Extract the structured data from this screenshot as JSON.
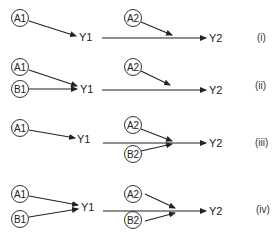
{
  "panels": [
    {
      "id": "i",
      "label": "(i)",
      "nodes": {
        "a1": "A1",
        "y1": "Y1",
        "a2": "A2",
        "y2": "Y2"
      }
    },
    {
      "id": "ii",
      "label": "(ii)",
      "nodes": {
        "a1": "A1",
        "b1": "B1",
        "y1": "Y1",
        "a2": "A2",
        "y2": "Y2"
      }
    },
    {
      "id": "iii",
      "label": "(iii)",
      "nodes": {
        "a1": "A1",
        "y1": "Y1",
        "a2": "A2",
        "b2": "B2",
        "y2": "Y2"
      }
    },
    {
      "id": "iv",
      "label": "(iv)",
      "nodes": {
        "a1": "A1",
        "b1": "B1",
        "y1": "Y1",
        "a2": "A2",
        "b2": "B2",
        "y2": "Y2"
      }
    }
  ],
  "colors": {
    "stroke": "#222222",
    "background": "#ffffff"
  }
}
